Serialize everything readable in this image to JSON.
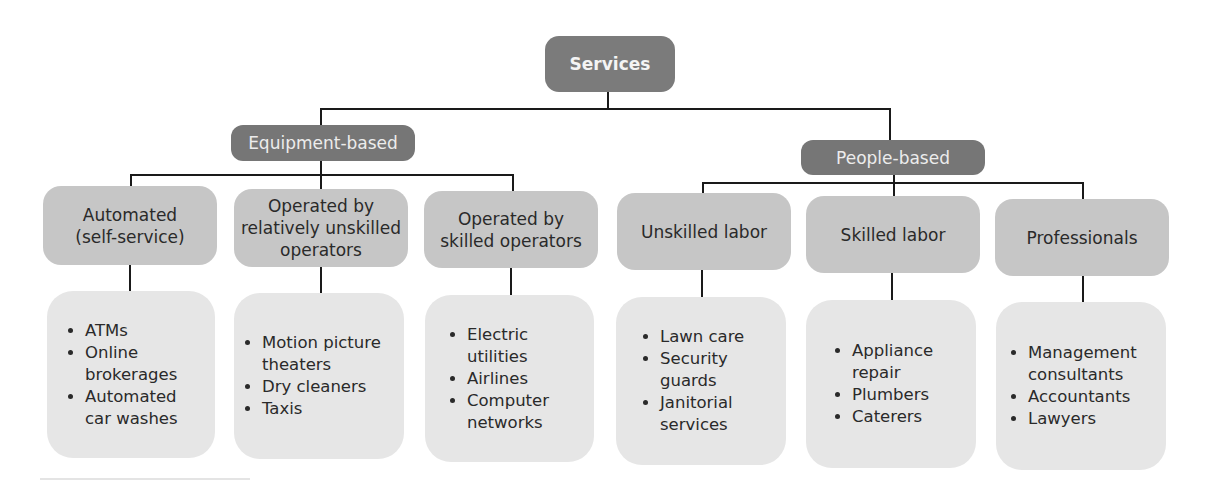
{
  "diagram": {
    "type": "hierarchy",
    "root": {
      "label": "Services"
    },
    "groups": [
      {
        "label": "Equipment-based",
        "categories": [
          {
            "label": "Automated (self-service)",
            "lines": [
              "Automated",
              "(self-service)"
            ],
            "examples": [
              "ATMs",
              "Online brokerages",
              "Automated car washes"
            ]
          },
          {
            "label": "Operated by relatively unskilled operators",
            "lines": [
              "Operated by",
              "relatively unskilled",
              "operators"
            ],
            "examples": [
              "Motion picture theaters",
              "Dry cleaners",
              "Taxis"
            ]
          },
          {
            "label": "Operated by skilled operators",
            "lines": [
              "Operated by",
              "skilled operators"
            ],
            "examples": [
              "Electric utilities",
              "Airlines",
              "Computer networks"
            ]
          }
        ]
      },
      {
        "label": "People-based",
        "categories": [
          {
            "label": "Unskilled labor",
            "lines": [
              "Unskilled labor"
            ],
            "examples": [
              "Lawn care",
              "Security guards",
              "Janitorial services"
            ]
          },
          {
            "label": "Skilled labor",
            "lines": [
              "Skilled labor"
            ],
            "examples": [
              "Appliance repair",
              "Plumbers",
              "Caterers"
            ]
          },
          {
            "label": "Professionals",
            "lines": [
              "Professionals"
            ],
            "examples": [
              "Management consultants",
              "Accountants",
              "Lawyers"
            ]
          }
        ]
      }
    ]
  },
  "display": {
    "ex0": [
      "ATMs",
      "Online\nbrokerages",
      "Automated\ncar washes"
    ],
    "ex1": [
      "Motion picture\ntheaters",
      "Dry cleaners",
      "Taxis"
    ],
    "ex2": [
      "Electric\nutilities",
      "Airlines",
      "Computer\nnetworks"
    ],
    "ex3": [
      "Lawn care",
      "Security\nguards",
      "Janitorial\nservices"
    ],
    "ex4": [
      "Appliance\nrepair",
      "Plumbers",
      "Caterers"
    ],
    "ex5": [
      "Management\nconsultants",
      "Accountants",
      "Lawyers"
    ]
  },
  "colors": {
    "root_fill": "#7b7b7b",
    "group_fill": "#767676",
    "category_fill": "#c6c6c6",
    "examples_fill": "#e6e6e6",
    "connector": "#1a1a1a",
    "background": "#ffffff"
  }
}
